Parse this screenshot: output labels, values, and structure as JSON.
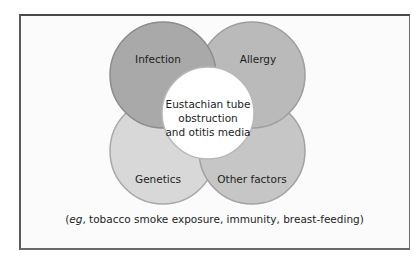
{
  "diagram": {
    "circles": [
      {
        "id": "infection",
        "label": "Infection",
        "fill": "#a9a9a9",
        "stroke": "#8c8c8c"
      },
      {
        "id": "allergy",
        "label": "Allergy",
        "fill": "#bababa",
        "stroke": "#9e9e9e"
      },
      {
        "id": "genetics",
        "label": "Genetics",
        "fill": "#d8d8d8",
        "stroke": "#a8a8a8"
      },
      {
        "id": "other-factors",
        "label": "Other factors",
        "fill": "#c6c6c6",
        "stroke": "#a2a2a2"
      }
    ],
    "center": {
      "lines": [
        "Eustachian tube",
        "obstruction",
        "and otitis media"
      ],
      "fill": "#ffffff",
      "stroke": "#b8b8b8"
    },
    "caption": {
      "open": "(",
      "italic": "eg",
      "rest": ", tobacco smoke exposure, immunity, breast-feeding)"
    },
    "frame_border_color": "#4a4a4a"
  }
}
